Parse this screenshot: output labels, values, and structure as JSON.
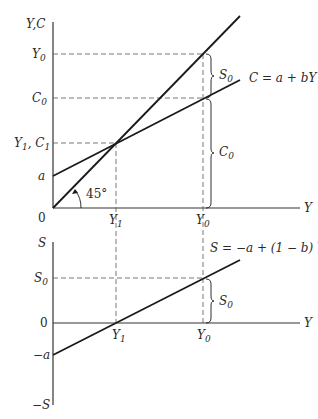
{
  "upper_panel": {
    "y_axis_label": "Y,C",
    "x_axis_label": "Y",
    "origin_label": "0",
    "y_ticks": {
      "y0": {
        "base": "Y",
        "sub": "0"
      },
      "c0": {
        "base": "C",
        "sub": "0"
      },
      "y1c1": {
        "base1": "Y",
        "sub1": "1",
        "sep": ", ",
        "base2": "C",
        "sub2": "1"
      },
      "a": "a"
    },
    "x_ticks": {
      "y1": {
        "base": "Y",
        "sub": "1"
      },
      "y0": {
        "base": "Y",
        "sub": "0"
      }
    },
    "angle_label": "45°",
    "consumption_function_label": "C = a + bY",
    "brace_s0": {
      "base": "S",
      "sub": "0"
    },
    "brace_c0": {
      "base": "C",
      "sub": "0"
    }
  },
  "lower_panel": {
    "y_axis_top_label": "S",
    "y_axis_bottom_label": "−S",
    "x_axis_label": "Y",
    "y_ticks": {
      "s0": {
        "base": "S",
        "sub": "0"
      },
      "zero": "0",
      "neg_a": "−a"
    },
    "x_ticks": {
      "y1": {
        "base": "Y",
        "sub": "1"
      },
      "y0": {
        "base": "Y",
        "sub": "0"
      }
    },
    "saving_function_label": "S = −a + (1 − b) Y",
    "brace_s0": {
      "base": "S",
      "sub": "0"
    }
  },
  "colors": {
    "line": "#1a1a1a",
    "axis": "#333333",
    "dashed": "#555555"
  }
}
